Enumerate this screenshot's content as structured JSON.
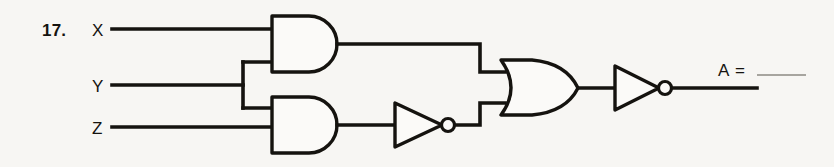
{
  "problem": {
    "number": "17.",
    "output_prefix": "A =",
    "answer_value": ""
  },
  "inputs": [
    {
      "label": "X",
      "name": "input-x"
    },
    {
      "label": "Y",
      "name": "input-y"
    },
    {
      "label": "Z",
      "name": "input-z"
    }
  ],
  "gates": [
    {
      "name": "and-gate-top",
      "type": "AND",
      "inputs": [
        "X",
        "Y"
      ]
    },
    {
      "name": "and-gate-bottom",
      "type": "AND",
      "inputs": [
        "Y",
        "Z"
      ]
    },
    {
      "name": "not-gate-middle",
      "type": "NOT",
      "inputs": [
        "and-gate-bottom"
      ]
    },
    {
      "name": "or-gate",
      "type": "OR",
      "inputs": [
        "and-gate-top",
        "not-gate-middle"
      ]
    },
    {
      "name": "not-gate-output",
      "type": "NOT",
      "inputs": [
        "or-gate"
      ]
    }
  ],
  "colors": {
    "ink": "#15130f",
    "paper": "#f7f6f3",
    "gate_fill": "#fbfaf8",
    "blank_rule": "#8d8a83"
  }
}
